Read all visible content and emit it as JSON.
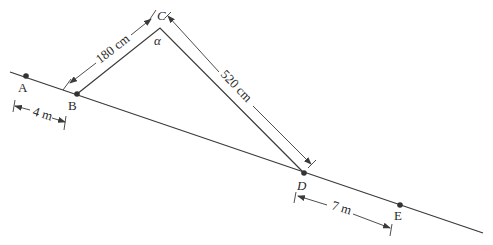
{
  "diagram": {
    "points": {
      "A": {
        "label": "A"
      },
      "B": {
        "label": "B"
      },
      "C": {
        "label": "C"
      },
      "D": {
        "label": "D"
      },
      "E": {
        "label": "E"
      }
    },
    "angle_label": "α",
    "dimensions": {
      "BC": "180 cm",
      "CD": "520 cm",
      "AB": "4 m",
      "DE": "7 m"
    },
    "colors": {
      "line": "#3a3a3a",
      "background": "#ffffff"
    }
  }
}
